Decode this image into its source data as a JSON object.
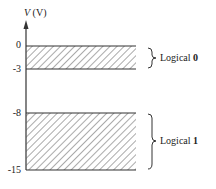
{
  "axis": {
    "variable": "V",
    "unit": "(V)"
  },
  "ticks": [
    {
      "label": "0",
      "value": 0
    },
    {
      "label": "-3",
      "value": -3
    },
    {
      "label": "-8",
      "value": -8
    },
    {
      "label": "-15",
      "value": -15
    }
  ],
  "regions": [
    {
      "name": "logical-0",
      "from": 0,
      "to": -3,
      "label_prefix": "Logical",
      "label_value": "0"
    },
    {
      "name": "logical-1",
      "from": -8,
      "to": -15,
      "label_prefix": "Logical",
      "label_value": "1"
    }
  ],
  "colors": {
    "line": "#333333",
    "hatch": "#555555",
    "background": "#ffffff"
  }
}
